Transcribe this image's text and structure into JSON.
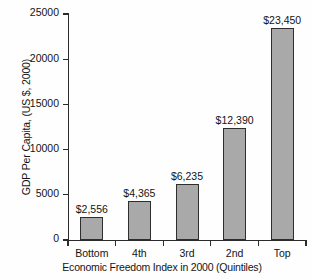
{
  "chart_data": {
    "type": "bar",
    "title": "",
    "xlabel": "Economic Freedom Index in 2000 (Quintiles)",
    "ylabel": "GDP Per Capita, (US $, 2000)",
    "categories": [
      "Bottom",
      "4th",
      "3rd",
      "2nd",
      "Top"
    ],
    "values": [
      2556,
      4365,
      6235,
      12390,
      23450
    ],
    "value_labels": [
      "$2,556",
      "$4,365",
      "$6,235",
      "$12,390",
      "$23,450"
    ],
    "ylim": [
      0,
      25000
    ],
    "yticks": [
      0,
      5000,
      10000,
      15000,
      20000,
      25000
    ],
    "ytick_labels": [
      "0",
      "5000",
      "10000",
      "15000",
      "20000",
      "25000"
    ],
    "grid": false,
    "legend": false,
    "bar_color": "#a9a9a9",
    "bar_edge_color": "#2e2e2e",
    "axis_color": "#2b2b2b",
    "background_color": "#fefefe"
  }
}
